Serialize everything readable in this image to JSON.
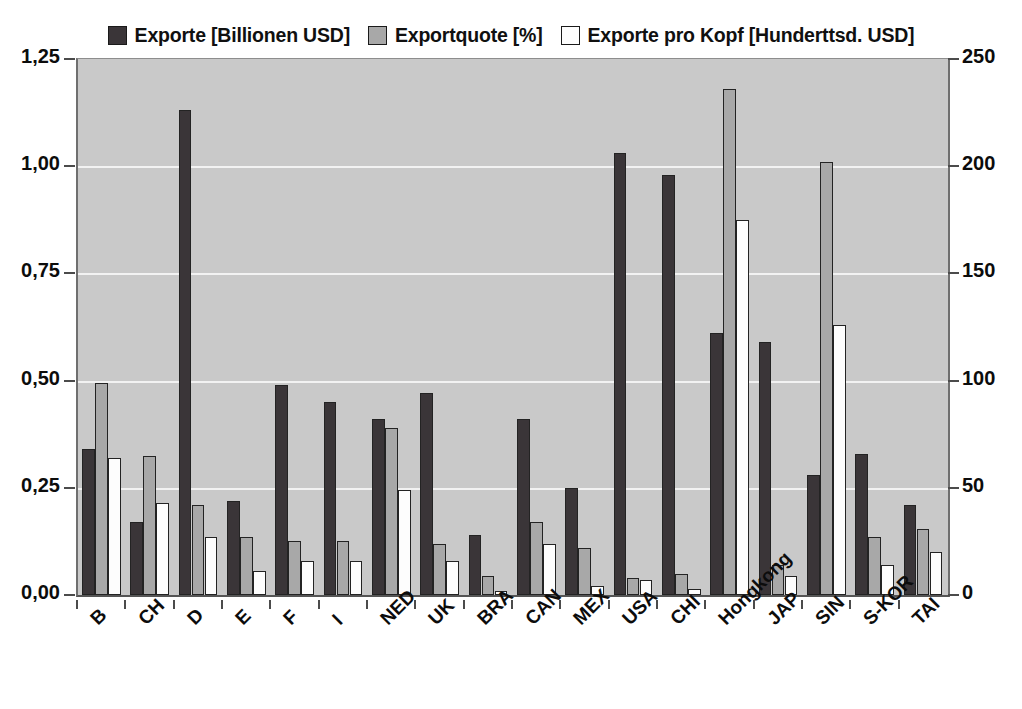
{
  "legend": {
    "entries": [
      {
        "label": "Exporte [Billionen USD]",
        "swatch": "legend-swatch-dark",
        "color": "#3a3538"
      },
      {
        "label": "Exportquote [%]",
        "swatch": "legend-swatch-gray",
        "color": "#a8a8a8"
      },
      {
        "label": "Exporte pro Kopf [Hunderttsd. USD]",
        "swatch": "legend-swatch-white",
        "color": "#fdfdfd"
      }
    ]
  },
  "axes": {
    "left_ticks": [
      "1,25",
      "1,00",
      "0,75",
      "0,50",
      "0,25",
      "0,00"
    ],
    "right_ticks": [
      "250",
      "200",
      "150",
      "100",
      "50",
      "0"
    ]
  },
  "chart_data": {
    "type": "bar",
    "title": "",
    "xlabel": "",
    "ylabel": "",
    "y2label": "",
    "grid": true,
    "legend_position": "top",
    "ylim": [
      0,
      1.25
    ],
    "y2lim": [
      0,
      250
    ],
    "categories": [
      "B",
      "CH",
      "D",
      "E",
      "F",
      "I",
      "NED",
      "UK",
      "BRA",
      "CAN",
      "MEX",
      "USA",
      "CHI",
      "Hongkong",
      "JAP",
      "SIN",
      "S-KOR",
      "TAI"
    ],
    "series": [
      {
        "name": "Exporte [Billionen USD]",
        "axis": "left",
        "color": "#3a3538",
        "values": [
          0.34,
          0.17,
          1.13,
          0.22,
          0.49,
          0.45,
          0.41,
          0.47,
          0.14,
          0.41,
          0.25,
          1.03,
          0.98,
          0.61,
          0.59,
          0.28,
          0.33,
          0.21
        ]
      },
      {
        "name": "Exportquote [%]",
        "axis": "right",
        "color": "#a8a8a8",
        "values": [
          99,
          65,
          42,
          27,
          25,
          25,
          78,
          24,
          9,
          34,
          22,
          8,
          10,
          236,
          14,
          202,
          27,
          31
        ]
      },
      {
        "name": "Exporte pro Kopf [Hunderttsd. USD]",
        "axis": "right",
        "color": "#fdfdfd",
        "values": [
          64,
          43,
          27,
          11,
          16,
          16,
          49,
          16,
          2,
          24,
          4,
          7,
          3,
          175,
          9,
          126,
          14,
          20
        ]
      }
    ]
  }
}
